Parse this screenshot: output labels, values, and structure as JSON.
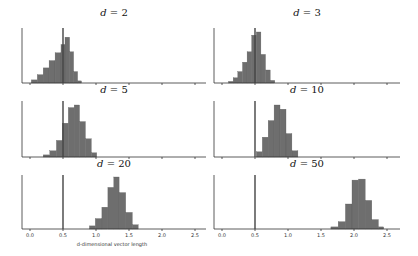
{
  "chart_data": {
    "type": "bar",
    "layout": "3x2 grid of histograms",
    "xlabel": "d-dimensional vector length",
    "xticks": [
      "0.0",
      "0.5",
      "1.0",
      "1.5",
      "2.0",
      "2.5"
    ],
    "xlim": [
      0.0,
      2.6
    ],
    "reference_line_x": 0.5,
    "grid": false,
    "legend": null,
    "panels": [
      {
        "title_var": "d",
        "title_val": "2",
        "title": "d = 2",
        "bins": [
          [
            0.02,
            0.11,
            0.06
          ],
          [
            0.11,
            0.2,
            0.16
          ],
          [
            0.2,
            0.29,
            0.29
          ],
          [
            0.29,
            0.38,
            0.43
          ],
          [
            0.38,
            0.47,
            0.58
          ],
          [
            0.47,
            0.53,
            0.74
          ],
          [
            0.53,
            0.6,
            0.88
          ],
          [
            0.6,
            0.66,
            0.6
          ],
          [
            0.66,
            0.72,
            0.22
          ],
          [
            0.72,
            0.78,
            0.04
          ]
        ]
      },
      {
        "title_var": "d",
        "title_val": "3",
        "title": "d = 3",
        "bins": [
          [
            0.1,
            0.17,
            0.03
          ],
          [
            0.17,
            0.24,
            0.1
          ],
          [
            0.24,
            0.31,
            0.22
          ],
          [
            0.31,
            0.38,
            0.4
          ],
          [
            0.38,
            0.45,
            0.6
          ],
          [
            0.45,
            0.52,
            0.92
          ],
          [
            0.52,
            0.59,
            0.98
          ],
          [
            0.59,
            0.66,
            0.55
          ],
          [
            0.66,
            0.73,
            0.25
          ],
          [
            0.73,
            0.8,
            0.05
          ]
        ]
      },
      {
        "title_var": "d",
        "title_val": "5",
        "title": "d = 5",
        "bins": [
          [
            0.2,
            0.3,
            0.04
          ],
          [
            0.3,
            0.4,
            0.12
          ],
          [
            0.4,
            0.49,
            0.32
          ],
          [
            0.49,
            0.58,
            0.65
          ],
          [
            0.58,
            0.67,
            0.95
          ],
          [
            0.67,
            0.75,
            1.0
          ],
          [
            0.75,
            0.84,
            0.68
          ],
          [
            0.84,
            0.93,
            0.35
          ],
          [
            0.93,
            1.01,
            0.08
          ]
        ]
      },
      {
        "title_var": "d",
        "title_val": "10",
        "title": "d = 10",
        "bins": [
          [
            0.52,
            0.61,
            0.1
          ],
          [
            0.61,
            0.7,
            0.38
          ],
          [
            0.7,
            0.79,
            0.7
          ],
          [
            0.79,
            0.88,
            1.0
          ],
          [
            0.88,
            0.97,
            0.92
          ],
          [
            0.97,
            1.06,
            0.45
          ],
          [
            1.06,
            1.15,
            0.12
          ]
        ]
      },
      {
        "title_var": "d",
        "title_val": "20",
        "title": "d = 20",
        "bins": [
          [
            0.9,
            0.99,
            0.06
          ],
          [
            0.99,
            1.09,
            0.2
          ],
          [
            1.09,
            1.18,
            0.42
          ],
          [
            1.18,
            1.27,
            0.8
          ],
          [
            1.27,
            1.35,
            1.0
          ],
          [
            1.35,
            1.45,
            0.7
          ],
          [
            1.45,
            1.55,
            0.32
          ],
          [
            1.55,
            1.64,
            0.08
          ]
        ]
      },
      {
        "title_var": "d",
        "title_val": "50",
        "title": "d = 50",
        "bins": [
          [
            1.65,
            1.76,
            0.04
          ],
          [
            1.76,
            1.87,
            0.14
          ],
          [
            1.87,
            1.97,
            0.48
          ],
          [
            1.97,
            2.07,
            0.94
          ],
          [
            2.07,
            2.17,
            0.96
          ],
          [
            2.17,
            2.27,
            0.55
          ],
          [
            2.27,
            2.37,
            0.18
          ],
          [
            2.37,
            2.45,
            0.04
          ]
        ]
      }
    ]
  }
}
